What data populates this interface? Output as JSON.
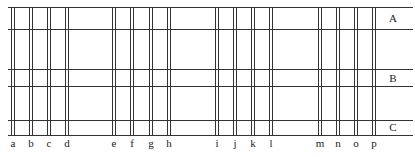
{
  "diagram": {
    "line_color": "#333333",
    "horizontal_lines_y": [
      7,
      29,
      69,
      86,
      120,
      135
    ],
    "x_start": 8,
    "x_end": 413,
    "row_labels": [
      {
        "text": "A",
        "x": 393,
        "y": 22
      },
      {
        "text": "B",
        "x": 393,
        "y": 82
      },
      {
        "text": "C",
        "x": 393,
        "y": 131
      }
    ],
    "columns": [
      {
        "label": "a",
        "x": 11
      },
      {
        "label": "b",
        "x": 29
      },
      {
        "label": "c",
        "x": 47
      },
      {
        "label": "d",
        "x": 65
      },
      {
        "label": "e",
        "x": 112
      },
      {
        "label": "f",
        "x": 130
      },
      {
        "label": "g",
        "x": 149
      },
      {
        "label": "h",
        "x": 167
      },
      {
        "label": "i",
        "x": 215
      },
      {
        "label": "j",
        "x": 233
      },
      {
        "label": "k",
        "x": 251
      },
      {
        "label": "l",
        "x": 269
      },
      {
        "label": "m",
        "x": 318
      },
      {
        "label": "n",
        "x": 336
      },
      {
        "label": "o",
        "x": 354
      },
      {
        "label": "p",
        "x": 372
      }
    ],
    "pair_gap": 3,
    "column_label_y": 147
  }
}
